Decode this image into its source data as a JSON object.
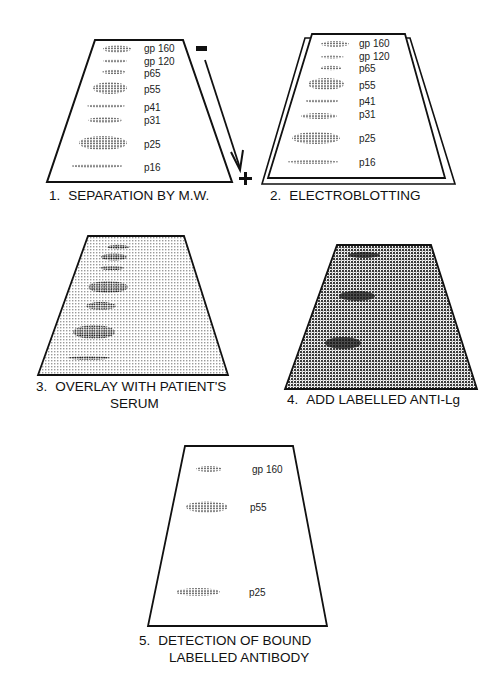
{
  "figure": {
    "steps": [
      {
        "number": "1.",
        "caption": "SEPARATION BY M.W.",
        "bands": [
          "gp 160",
          "gp 120",
          "p65",
          "p55",
          "p41",
          "p31",
          "p25",
          "p16"
        ],
        "electrode_negative": "-",
        "electrode_positive": "+"
      },
      {
        "number": "2.",
        "caption": "ELECTROBLOTTING",
        "bands": [
          "gp 160",
          "gp 120",
          "p65",
          "p55",
          "p41",
          "p31",
          "p25",
          "p16"
        ]
      },
      {
        "number": "3.",
        "caption_line1": "OVERLAY WITH PATIENT'S",
        "caption_line2": "SERUM"
      },
      {
        "number": "4.",
        "caption": "ADD LABELLED ANTI-Lg"
      },
      {
        "number": "5.",
        "caption_line1": "DETECTION OF BOUND",
        "caption_line2": "LABELLED ANTIBODY",
        "bands": [
          "gp 160",
          "p55",
          "p25"
        ]
      }
    ]
  },
  "colors": {
    "ink": "#111111",
    "background": "#ffffff",
    "light_stipple": "#d9d9d9",
    "dark_stipple": "#8c8c8c"
  }
}
